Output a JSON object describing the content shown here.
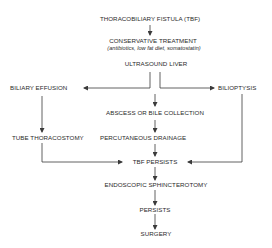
{
  "diagram": {
    "type": "flowchart",
    "nodes": {
      "tbf": "THORACOBILIARY FISTULA (TBF)",
      "conservative": "CONSERVATIVE TREATMENT",
      "conservative_note": "(antibiotics, low fat diet, somatostatin)",
      "ultrasound": "ULTRASOUND LIVER",
      "biliary_effusion": "BILIARY EFFUSION",
      "bilioptysis": "BILIOPTYSIS",
      "abscess": "ABSCESS OR BILE COLLECTION",
      "tube_thoracostomy": "TUBE THORACOSTOMY",
      "percutaneous_drainage": "PERCUTANEOUS DRAINAGE",
      "tbf_persists": "TBF PERSISTS",
      "endoscopic": "ENDOSCOPIC SPHINCTEROTOMY",
      "persists": "PERSISTS",
      "surgery": "SURGERY"
    },
    "edges": [
      {
        "from": "THORACOBILIARY FISTULA (TBF)",
        "to": "CONSERVATIVE TREATMENT"
      },
      {
        "from": "ULTRASOUND LIVER",
        "to": "BILIARY EFFUSION"
      },
      {
        "from": "ULTRASOUND LIVER",
        "to": "ABSCESS OR BILE COLLECTION"
      },
      {
        "from": "ULTRASOUND LIVER",
        "to": "BILIOPTYSIS"
      },
      {
        "from": "BILIARY EFFUSION",
        "to": "TUBE THORACOSTOMY"
      },
      {
        "from": "ABSCESS OR BILE COLLECTION",
        "to": "PERCUTANEOUS DRAINAGE"
      },
      {
        "from": "TUBE THORACOSTOMY",
        "to": "TBF PERSISTS"
      },
      {
        "from": "PERCUTANEOUS DRAINAGE",
        "to": "TBF PERSISTS"
      },
      {
        "from": "BILIOPTYSIS",
        "to": "TBF PERSISTS"
      },
      {
        "from": "TBF PERSISTS",
        "to": "ENDOSCOPIC SPHINCTEROTOMY"
      },
      {
        "from": "ENDOSCOPIC SPHINCTEROTOMY",
        "to": "PERSISTS"
      },
      {
        "from": "PERSISTS",
        "to": "SURGERY"
      }
    ],
    "colors": {
      "line": "#3a3a3a",
      "text": "#2a2a2a",
      "background": "#ffffff"
    }
  }
}
